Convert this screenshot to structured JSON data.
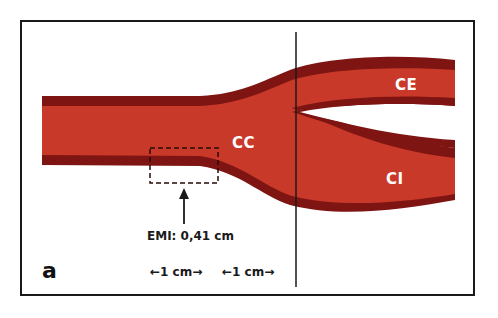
{
  "figure": {
    "panel_label": "a",
    "colors": {
      "vessel_fill": "#c9392a",
      "vessel_wall": "#7e1512",
      "frame": "#1a1a1a",
      "label_text": "#ffffff",
      "annotation_text": "#1a1a1a"
    },
    "vessels": {
      "common": "CC",
      "external": "CE",
      "internal": "CI"
    },
    "measurement": {
      "label": "EMI: 0,41 cm"
    },
    "scale": {
      "segment1": "←1 cm→",
      "segment2": "←1 cm→"
    }
  }
}
